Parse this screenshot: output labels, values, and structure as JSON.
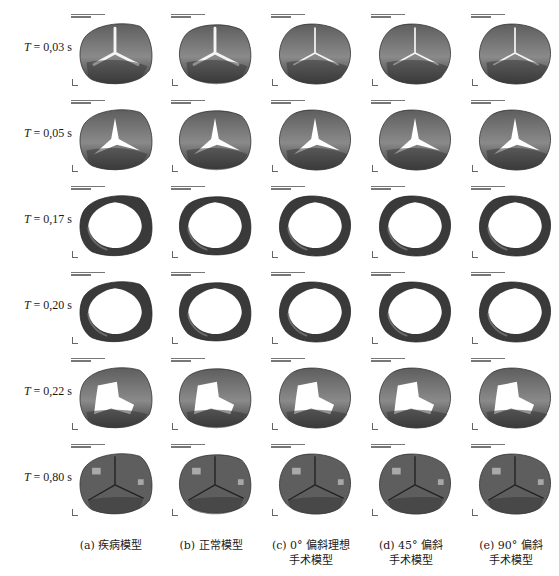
{
  "figure": {
    "rows": [
      {
        "label_prefix": "T",
        "label_value": " = 0,03 s",
        "state": "closed-star"
      },
      {
        "label_prefix": "T",
        "label_value": " = 0,05 s",
        "state": "opening-star"
      },
      {
        "label_prefix": "T",
        "label_value": " = 0,17 s",
        "state": "open-ring"
      },
      {
        "label_prefix": "T",
        "label_value": " = 0,20 s",
        "state": "open-ring"
      },
      {
        "label_prefix": "T",
        "label_value": " = 0,22 s",
        "state": "closing"
      },
      {
        "label_prefix": "T",
        "label_value": " = 0,80 s",
        "state": "closed-coapted"
      }
    ],
    "columns": [
      {
        "caption_line1": "(a) 疾病模型",
        "caption_line2": ""
      },
      {
        "caption_line1": "(b) 正常模型",
        "caption_line2": ""
      },
      {
        "caption_line1": "(c) 0° 偏斜理想",
        "caption_line2": "手术模型"
      },
      {
        "caption_line1": "(d) 45° 偏斜",
        "caption_line2": "手术模型"
      },
      {
        "caption_line1": "(e) 90° 偏斜",
        "caption_line2": "手术模型"
      }
    ],
    "colors": {
      "leaflet_dark": "#3a3a3a",
      "leaflet_mid": "#5e5e5e",
      "leaflet_light": "#8a8a8a",
      "background": "#ffffff"
    }
  }
}
